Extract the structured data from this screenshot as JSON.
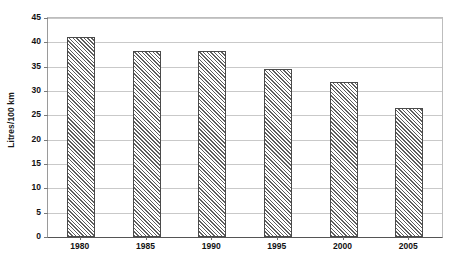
{
  "chart_data": {
    "type": "bar",
    "title": "",
    "subtitle": "",
    "xlabel": "",
    "ylabel": "Litres/100 km",
    "categories": [
      "1980",
      "1985",
      "1990",
      "1995",
      "2000",
      "2005"
    ],
    "values": [
      41,
      38.3,
      38.2,
      34.5,
      31.8,
      26.5
    ],
    "series": [
      {
        "name": "Fuel consumption",
        "values": [
          41,
          38.3,
          38.2,
          34.5,
          31.8,
          26.5
        ]
      }
    ],
    "ylim": [
      0,
      45
    ],
    "ytick_step": 5,
    "yticks": [
      0,
      5,
      10,
      15,
      20,
      25,
      30,
      35,
      40,
      45
    ],
    "ytick_labels": [
      "0",
      "5",
      "10",
      "15",
      "20",
      "25",
      "30",
      "35",
      "40",
      "45"
    ],
    "grid": "horizontal",
    "legend": "none",
    "legend_position": "",
    "annotations": [],
    "bar_fill": "diagonal-hatch",
    "colors": {
      "bar_outline": "#4a4a4a",
      "bar_hatch": "#5e5e5e",
      "bar_background": "#ffffff",
      "gridline": "#c9c9c9",
      "axis": "#555555",
      "text": "#111111",
      "plot_background": "#ffffff"
    }
  }
}
